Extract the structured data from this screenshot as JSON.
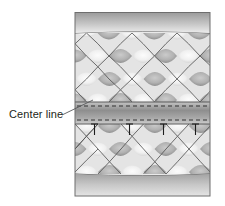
{
  "figure": {
    "name": "quilted-panel-center-line-diagram",
    "type": "technical-illustration",
    "background_color": "#ffffff",
    "panel": {
      "x": 75,
      "y": 12,
      "width": 135,
      "height": 184,
      "border_color": "#6e6e6e",
      "fill_color": "#e8e8e8"
    }
  },
  "callout": {
    "label": "Center line",
    "text_x": 9,
    "text_y": 118,
    "text_color": "#231f20",
    "leader": {
      "from_x": 62,
      "from_y": 115,
      "to_x": 93,
      "to_y": 100,
      "color": "#58595b"
    }
  },
  "bands": {
    "top": {
      "name": "top-plain-band",
      "y": 13,
      "height": 20,
      "gradient_from": "#9d9d9d",
      "gradient_to": "#e6e6e6"
    },
    "center": {
      "name": "center-line-band",
      "y": 102,
      "height": 22,
      "gradient_from": "#8e8e8e",
      "gradient_to": "#c9c9c9",
      "stitch_line_color": "#3a3a3a",
      "stitch_dash": "4 3",
      "stitch_offsets": [
        4,
        18
      ]
    },
    "bottom": {
      "name": "bottom-plain-band",
      "y": 174,
      "height": 22,
      "gradient_from": "#a4a4a4",
      "gradient_to": "#e2e2e2"
    }
  },
  "quilt": {
    "name": "quilted-diamond-pattern",
    "seam_color": "#4a4a4a",
    "light_fill_center": "#fbfbfb",
    "light_fill_edge": "#d2d2d2",
    "dark_fill_center": "#bdbdbd",
    "dark_fill_edge": "#8c8c8c",
    "diamond_half_width": 22.5,
    "diamond_half_height": 23,
    "upper_section": {
      "top": 33,
      "bottom": 102
    },
    "lower_section": {
      "top": 124,
      "bottom": 174
    }
  },
  "pins": {
    "name": "pin-markers",
    "count": 4,
    "color": "#1d1d1d",
    "head_width": 7,
    "shaft_length": 11,
    "top_y": 124,
    "x_positions": [
      95,
      130,
      164,
      196
    ]
  }
}
